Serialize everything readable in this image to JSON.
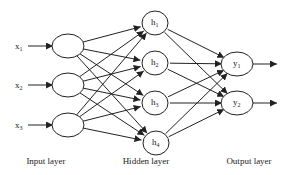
{
  "diagram": {
    "type": "feedforward-neural-network",
    "layers": [
      {
        "name": "Input layer",
        "nodes": [
          {
            "id": "x1",
            "base": "x",
            "sub": "1",
            "cx": 68,
            "cy": 46
          },
          {
            "id": "x2",
            "base": "x",
            "sub": "2",
            "cx": 68,
            "cy": 85
          },
          {
            "id": "x3",
            "base": "x",
            "sub": "3",
            "cx": 68,
            "cy": 125
          }
        ],
        "label_x": 46
      },
      {
        "name": "Hidden layer",
        "nodes": [
          {
            "id": "h1",
            "base": "h",
            "sub": "1",
            "cx": 155,
            "cy": 23
          },
          {
            "id": "h2",
            "base": "h",
            "sub": "2",
            "cx": 155,
            "cy": 63
          },
          {
            "id": "h3",
            "base": "h",
            "sub": "3",
            "cx": 155,
            "cy": 103
          },
          {
            "id": "h4",
            "base": "h",
            "sub": "4",
            "cx": 156,
            "cy": 143
          }
        ],
        "label_x": 146
      },
      {
        "name": "Output layer",
        "nodes": [
          {
            "id": "y1",
            "base": "y",
            "sub": "1",
            "cx": 237,
            "cy": 64
          },
          {
            "id": "y2",
            "base": "y",
            "sub": "2",
            "cx": 237,
            "cy": 103
          }
        ],
        "label_x": 249
      }
    ],
    "connectivity": "fully-connected",
    "input_arrows": true,
    "output_arrows": true,
    "layer_label_y": 164,
    "colors": {
      "stroke": "#222222",
      "background": "#ffffff"
    }
  }
}
